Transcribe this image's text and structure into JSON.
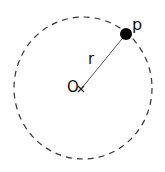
{
  "diagram": {
    "type": "circle-with-radius",
    "colors": {
      "stroke": "#333333",
      "point_fill": "#000000",
      "background": "#ffffff"
    },
    "circle": {
      "style": "dashed",
      "center": [
        83,
        88
      ],
      "radius": 70
    },
    "center_point": {
      "label": "O",
      "marker": "x-mark-icon",
      "position": [
        81,
        89
      ]
    },
    "point": {
      "label": "p",
      "marker": "filled-dot",
      "position": [
        126,
        34
      ],
      "radius": 6
    },
    "radius_segment": {
      "label": "r",
      "from": "O",
      "to": "p"
    }
  }
}
